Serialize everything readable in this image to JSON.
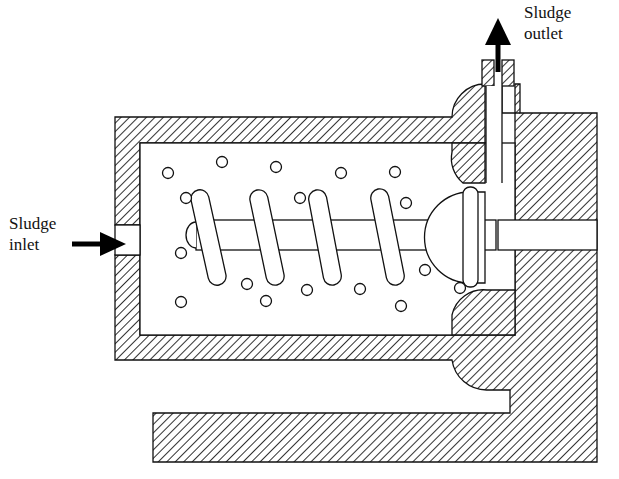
{
  "labels": {
    "outlet_line1": "Sludge",
    "outlet_line2": "outlet",
    "inlet_line1": "Sludge",
    "inlet_line2": "inlet"
  },
  "colors": {
    "line": "#111111",
    "hatch": "#1a1a1a",
    "background": "#ffffff"
  },
  "particles": [
    [
      168,
      173
    ],
    [
      222,
      162
    ],
    [
      276,
      167
    ],
    [
      341,
      173
    ],
    [
      395,
      172
    ],
    [
      186,
      198
    ],
    [
      300,
      198
    ],
    [
      406,
      203
    ],
    [
      181,
      253
    ],
    [
      425,
      270
    ],
    [
      247,
      284
    ],
    [
      307,
      290
    ],
    [
      360,
      289
    ],
    [
      460,
      288
    ],
    [
      181,
      302
    ],
    [
      266,
      301
    ],
    [
      401,
      306
    ]
  ],
  "flights": [
    {
      "x1": 198,
      "y1": 190,
      "x2": 219,
      "y2": 285
    },
    {
      "x1": 257,
      "y1": 190,
      "x2": 277,
      "y2": 285
    },
    {
      "x1": 316,
      "y1": 190,
      "x2": 334,
      "y2": 285
    },
    {
      "x1": 378,
      "y1": 189,
      "x2": 397,
      "y2": 285
    }
  ]
}
